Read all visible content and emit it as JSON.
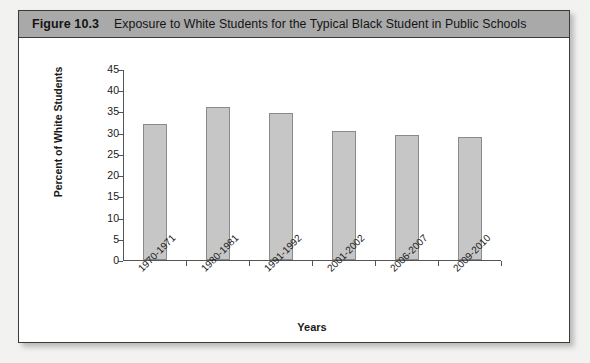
{
  "figure": {
    "number": "Figure 10.3",
    "title": "Exposure to White Students for the Typical Black Student in Public Schools"
  },
  "colors": {
    "header_band": "#a9a9a9",
    "bar_fill": "#c6c6c6",
    "bar_border": "#8a8a8a",
    "axis": "#555555",
    "card_border": "#3a3a3a",
    "page_background": "#f2f2f0"
  },
  "chart_data": {
    "type": "bar",
    "title": "Exposure to White Students for the Typical Black Student in Public Schools",
    "categories": [
      "1970-1971",
      "1980-1981",
      "1991-1992",
      "2001-2002",
      "2006-2007",
      "2009-2010"
    ],
    "values": [
      32.0,
      36.0,
      34.7,
      30.4,
      29.5,
      29.1
    ],
    "xlabel": "Years",
    "ylabel": "Percent of White Students",
    "ylim": [
      0,
      45
    ],
    "yticks": [
      0,
      5,
      10,
      15,
      20,
      25,
      30,
      35,
      40,
      45
    ],
    "ytick_labels": [
      "0",
      "5",
      "10",
      "15",
      "20",
      "25",
      "30",
      "35",
      "40",
      "45"
    ],
    "grid": false,
    "legend": false,
    "legend_position": "none"
  }
}
